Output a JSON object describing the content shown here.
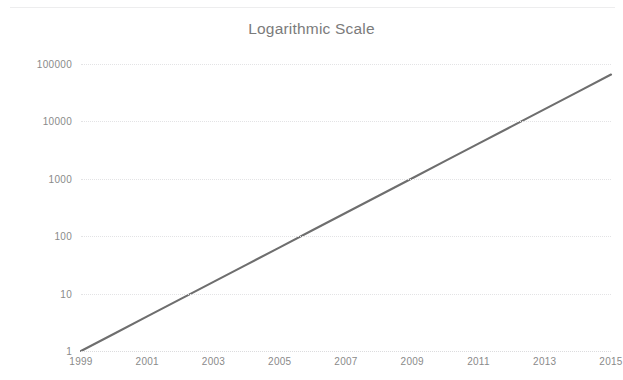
{
  "chart_data": {
    "type": "line",
    "title": "Logarithmic Scale",
    "xlabel": "",
    "ylabel": "",
    "yscale": "log",
    "ylim": [
      1,
      100000
    ],
    "xlim": [
      1999,
      2015
    ],
    "grid": true,
    "legend": false,
    "legend_position": "none",
    "y_ticks": [
      1,
      10,
      100,
      1000,
      10000,
      100000
    ],
    "y_tick_labels": [
      "1",
      "10",
      "100",
      "1000",
      "10000",
      "100000"
    ],
    "x_ticks": [
      1999,
      2001,
      2003,
      2005,
      2007,
      2009,
      2011,
      2013,
      2015
    ],
    "x_tick_labels": [
      "1999",
      "2001",
      "2003",
      "2005",
      "2007",
      "2009",
      "2011",
      "2013",
      "2015"
    ],
    "series": [
      {
        "name": "Series 1",
        "color": "#6e6e6e",
        "x": [
          1999,
          2000,
          2001,
          2002,
          2003,
          2004,
          2005,
          2006,
          2007,
          2008,
          2009,
          2010,
          2011,
          2012,
          2013,
          2014,
          2015
        ],
        "values": [
          1,
          2,
          4,
          8,
          16,
          32,
          64,
          128,
          256,
          512,
          1024,
          2048,
          4096,
          8192,
          16384,
          32768,
          65536
        ]
      }
    ]
  },
  "chart": {
    "title": "Logarithmic Scale",
    "line_color": "#6e6e6e",
    "grid_color": "#e3e3e5",
    "text_color": "#8a8a8a",
    "background": "#ffffff"
  }
}
